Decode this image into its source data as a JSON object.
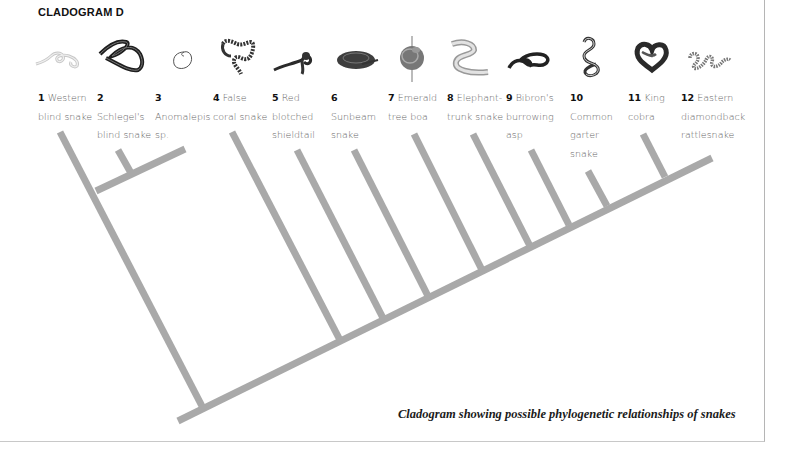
{
  "title": "CLADOGRAM D",
  "caption": "Cladogram showing possible phylogenetic relationships of snakes",
  "colors": {
    "branch": "#a9a9a9",
    "label_text": "#666666",
    "number_text": "#111111"
  },
  "taxa": [
    {
      "num": "1",
      "lines": [
        "Western",
        "blind snake"
      ],
      "icon": "western-blind-snake-icon"
    },
    {
      "num": "2",
      "lines": [
        "",
        "Schlegel's",
        "blind snake"
      ],
      "icon": "schlegels-blind-snake-icon"
    },
    {
      "num": "3",
      "lines": [
        "",
        "Anomalepis",
        "sp."
      ],
      "icon": "anomalepis-icon"
    },
    {
      "num": "4",
      "lines": [
        "False",
        "coral snake"
      ],
      "icon": "false-coral-snake-icon"
    },
    {
      "num": "5",
      "lines": [
        "Red",
        "blotched",
        "shieldtail"
      ],
      "icon": "red-blotched-shieldtail-icon"
    },
    {
      "num": "6",
      "lines": [
        "",
        "Sunbeam",
        "snake"
      ],
      "icon": "sunbeam-snake-icon"
    },
    {
      "num": "7",
      "lines": [
        "Emerald",
        "tree boa"
      ],
      "icon": "emerald-tree-boa-icon"
    },
    {
      "num": "8",
      "lines": [
        "Elephant-",
        "trunk snake"
      ],
      "icon": "elephant-trunk-snake-icon"
    },
    {
      "num": "9",
      "lines": [
        "Bibron's",
        "burrowing",
        "asp"
      ],
      "icon": "bibrons-burrowing-asp-icon"
    },
    {
      "num": "10",
      "lines": [
        "",
        "Common",
        "garter",
        "snake"
      ],
      "icon": "common-garter-snake-icon"
    },
    {
      "num": "11",
      "lines": [
        "King",
        "cobra"
      ],
      "icon": "king-cobra-icon"
    },
    {
      "num": "12",
      "lines": [
        "Eastern",
        "diamondback",
        "rattlesnake"
      ],
      "icon": "eastern-diamondback-rattlesnake-icon"
    }
  ]
}
